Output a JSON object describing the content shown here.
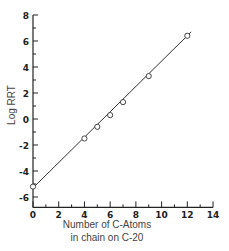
{
  "chart_data": {
    "type": "scatter",
    "title": "",
    "xlabel": "Number of C-Atoms in chain on C-20",
    "xlabel_lines": [
      "Number of C-Atoms",
      "in chain on C-20"
    ],
    "ylabel": "Log RRT",
    "xlim": [
      0,
      14
    ],
    "ylim": [
      -6.8,
      8
    ],
    "x_ticks": [
      0,
      2,
      4,
      6,
      8,
      10,
      12,
      14
    ],
    "y_ticks": [
      8,
      6,
      4,
      2,
      0,
      -2,
      -4,
      -6
    ],
    "grid": false,
    "legend": null,
    "series": [
      {
        "name": "data",
        "marker": "open-circle",
        "x": [
          0,
          4,
          5,
          6,
          7,
          9,
          12
        ],
        "y": [
          -5.2,
          -1.5,
          -0.6,
          0.3,
          1.3,
          3.3,
          6.4
        ]
      }
    ],
    "fit_line": {
      "x": [
        0,
        12.3
      ],
      "y": [
        -5.3,
        6.7
      ]
    }
  }
}
